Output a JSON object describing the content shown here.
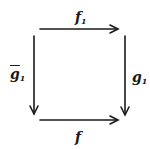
{
  "diagram": {
    "type": "commutative-square",
    "labels": {
      "top": {
        "base": "f",
        "sub": "1"
      },
      "left": {
        "base": "g",
        "sub": "1",
        "accent": "bar"
      },
      "right": {
        "base": "g",
        "sub": "1"
      },
      "bottom": {
        "base": "f",
        "sub": ""
      }
    },
    "arrows": [
      {
        "name": "top",
        "from": "top-left",
        "to": "top-right",
        "label": "f1"
      },
      {
        "name": "left",
        "from": "top-left",
        "to": "bottom-left",
        "label": "g-bar1"
      },
      {
        "name": "right",
        "from": "top-right",
        "to": "bottom-right",
        "label": "g1"
      },
      {
        "name": "bottom",
        "from": "bottom-left",
        "to": "bottom-right",
        "label": "f"
      }
    ],
    "stroke_color": "#1a1a1a"
  }
}
